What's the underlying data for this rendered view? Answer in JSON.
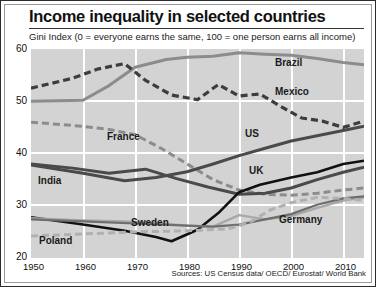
{
  "header": {
    "title": "Income inequality in selected countries",
    "subtitle": "Gini Index (0 = everyone earns the same, 100 = one person earns all income)"
  },
  "footer": {
    "source": "Sources: US Census data/ OECD/ Eurostat/ World Bank"
  },
  "axis": {
    "y_ticks": [
      "60",
      "50",
      "40",
      "30",
      "20"
    ],
    "x_ticks": [
      "1950",
      "1960",
      "1970",
      "1980",
      "1990",
      "2000",
      "2010"
    ]
  },
  "labels": {
    "brazil": "Brazil",
    "mexico": "Mexico",
    "us": "US",
    "uk": "UK",
    "france": "France",
    "india": "India",
    "sweden": "Sweden",
    "poland": "Poland",
    "germany": "Germany"
  },
  "colors": {
    "dark": "#3d3d3d",
    "mid_gray": "#8c8c8c",
    "light_gray": "#b0b0b0",
    "black": "#111111",
    "plot_bg": "#d3d3d3",
    "grid": "#ffffff"
  },
  "chart_data": {
    "type": "line",
    "title": "Income inequality in selected countries",
    "subtitle": "Gini Index (0 = everyone earns the same, 100 = one person earns all income)",
    "xlabel": "",
    "ylabel": "Gini Index",
    "xlim": [
      1950,
      2014
    ],
    "ylim": [
      20,
      60
    ],
    "y_ticks": [
      20,
      30,
      40,
      50,
      60
    ],
    "x_ticks": [
      1950,
      1960,
      1970,
      1980,
      1990,
      2000,
      2010
    ],
    "grid": true,
    "legend": "inline-labels",
    "source": "Sources: US Census data/ OECD/ Eurostat/ World Bank",
    "series": [
      {
        "name": "Brazil",
        "style": "solid",
        "color": "#8c8c8c",
        "width": 3.0,
        "x": [
          1950,
          1960,
          1965,
          1970,
          1976,
          1980,
          1985,
          1990,
          1995,
          2000,
          2005,
          2010,
          2014
        ],
        "y": [
          50.0,
          50.2,
          53.0,
          56.5,
          58.0,
          58.4,
          58.6,
          59.3,
          59.0,
          58.8,
          58.2,
          57.4,
          57.0
        ]
      },
      {
        "name": "Mexico",
        "style": "dashed",
        "color": "#3d3d3d",
        "width": 3.2,
        "x": [
          1950,
          1958,
          1963,
          1968,
          1972,
          1977,
          1982,
          1986,
          1990,
          1994,
          1998,
          2002,
          2006,
          2010,
          2014
        ],
        "y": [
          52.5,
          54.4,
          56.2,
          57.2,
          54.0,
          51.2,
          50.3,
          53.2,
          51.0,
          51.4,
          49.0,
          46.8,
          46.2,
          45.0,
          46.2
        ]
      },
      {
        "name": "France",
        "style": "dashed",
        "color": "#8c8c8c",
        "width": 3.0,
        "x": [
          1950,
          1960,
          1965,
          1970,
          1975,
          1980,
          1985,
          1990,
          1995,
          2000,
          2005,
          2010,
          2014
        ],
        "y": [
          46.0,
          45.2,
          44.6,
          43.6,
          41.0,
          38.0,
          35.0,
          33.0,
          32.2,
          32.0,
          32.4,
          33.0,
          33.4
        ]
      },
      {
        "name": "India",
        "style": "solid",
        "color": "#4a4a4a",
        "width": 3.0,
        "x": [
          1950,
          1958,
          1965,
          1972,
          1978,
          1984,
          1990,
          1995,
          2000,
          2005,
          2010,
          2014
        ],
        "y": [
          38.0,
          37.2,
          36.2,
          37.0,
          35.2,
          33.6,
          32.2,
          32.4,
          33.4,
          35.0,
          36.4,
          37.4
        ]
      },
      {
        "name": "US",
        "style": "solid",
        "color": "#4a4a4a",
        "width": 3.0,
        "x": [
          1950,
          1960,
          1968,
          1974,
          1980,
          1985,
          1990,
          1995,
          2000,
          2005,
          2010,
          2014
        ],
        "y": [
          37.8,
          36.2,
          34.8,
          35.4,
          36.5,
          38.0,
          39.6,
          41.0,
          42.4,
          43.4,
          44.4,
          45.2
        ]
      },
      {
        "name": "UK",
        "style": "solid",
        "color": "#111111",
        "width": 2.6,
        "x": [
          1950,
          1960,
          1968,
          1974,
          1977,
          1982,
          1986,
          1990,
          1994,
          2000,
          2005,
          2010,
          2014
        ],
        "y": [
          27.8,
          26.4,
          25.2,
          24.0,
          23.2,
          25.4,
          28.6,
          32.6,
          34.0,
          35.4,
          36.4,
          38.0,
          38.6
        ]
      },
      {
        "name": "Sweden",
        "style": "solid",
        "color": "#a8a8a8",
        "width": 2.4,
        "x": [
          1950,
          1960,
          1968,
          1975,
          1980,
          1985,
          1990,
          1995,
          2000,
          2005,
          2010,
          2014
        ],
        "y": [
          27.6,
          27.2,
          27.0,
          26.6,
          26.2,
          26.0,
          28.2,
          27.4,
          28.0,
          29.6,
          31.0,
          31.6
        ]
      },
      {
        "name": "Germany",
        "style": "solid",
        "color": "#6e6e6e",
        "width": 2.2,
        "x": [
          1950,
          1960,
          1970,
          1980,
          1985,
          1990,
          1995,
          2000,
          2005,
          2010,
          2014
        ],
        "y": [
          27.4,
          27.0,
          26.6,
          26.2,
          26.0,
          26.4,
          27.4,
          28.4,
          30.2,
          31.4,
          31.8
        ]
      },
      {
        "name": "Poland",
        "style": "dashed",
        "color": "#b0b0b0",
        "width": 3.0,
        "x": [
          1950,
          1960,
          1970,
          1980,
          1988,
          1992,
          1996,
          2000,
          2005,
          2010,
          2014
        ],
        "y": [
          24.2,
          24.6,
          25.0,
          25.2,
          25.6,
          26.8,
          29.2,
          30.6,
          31.6,
          31.4,
          31.0
        ]
      }
    ]
  }
}
